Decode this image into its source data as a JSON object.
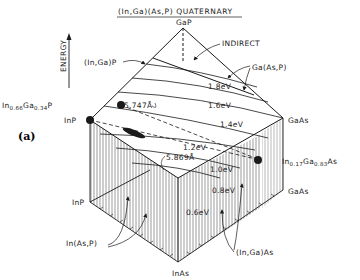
{
  "title": "(In,Ga)(As,P) QUATERNARY",
  "panel_label": "(a)",
  "axis_label": "ENERGY",
  "vertices": {
    "top": "GaP",
    "left": "InP",
    "right": "GaAs",
    "bottom": "InAs",
    "base_left": "InP",
    "base_right": "GaAs"
  },
  "region_labels": {
    "indirect": "INDIRECT",
    "in_ga_p": "(In,Ga)P",
    "ga_as_p": "Ga(As,P)",
    "in_as_p": "In(As,P)",
    "in_ga_as": "(In,Ga)As"
  },
  "contours": [
    {
      "label": "1.8eV"
    },
    {
      "label": "1.6eV"
    },
    {
      "label": "1.4eV"
    },
    {
      "label": "1.2eV"
    },
    {
      "label": "1.0eV"
    },
    {
      "label": "0.8eV"
    },
    {
      "label": "0.6eV"
    }
  ],
  "lattice_lines": [
    {
      "label": "5.747Å"
    },
    {
      "label": "5.869Å"
    }
  ],
  "compositions": {
    "ingap_main": "In",
    "ingap_sub1": "0.66",
    "ingap_ga": "Ga",
    "ingap_sub2": "0.34",
    "ingap_p": "P",
    "ingaas_main": "In",
    "ingaas_sub1": "0.17",
    "ingaas_ga": "Ga",
    "ingaas_sub2": "0.83",
    "ingaas_as": "As"
  }
}
